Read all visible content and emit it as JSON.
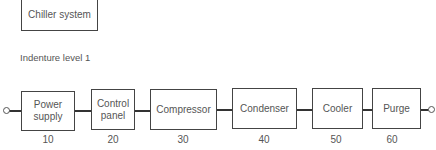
{
  "system_box": {
    "label": "Chiller system"
  },
  "level_label": "Indenture level 1",
  "blocks": [
    {
      "label": "Power\nsupply",
      "number": "10"
    },
    {
      "label": "Control\npanel",
      "number": "20"
    },
    {
      "label": "Compressor",
      "number": "30"
    },
    {
      "label": "Condenser",
      "number": "40"
    },
    {
      "label": "Cooler",
      "number": "50"
    },
    {
      "label": "Purge",
      "number": "60"
    }
  ],
  "terminals": {
    "input": "circle-terminal",
    "output": "circle-terminal"
  }
}
